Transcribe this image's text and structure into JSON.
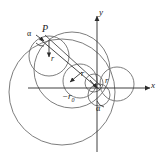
{
  "figure": {
    "type": "geometric-diagram",
    "background_color": "#ffffff",
    "circle_stroke_color": "#6e6e6e",
    "axis_color": "#2b2b2b",
    "line_color": "#333333"
  },
  "axes": {
    "x_label": "x",
    "y_label": "y",
    "origin_x": 97,
    "origin_y": 88,
    "x_axis_y": 88,
    "y_axis_x": 97,
    "x_range_px": [
      28,
      152
    ],
    "y_range_px": [
      14,
      152
    ]
  },
  "labels": {
    "point_p": "P",
    "alpha_upper": "α",
    "alpha_lower": "α",
    "radius_1": "r",
    "radius_2": "r",
    "radius_3": "r",
    "r_zero": "−r",
    "r_zero_sub": "0"
  },
  "circles": [
    {
      "name": "outer-large-circle",
      "cx": 62,
      "cy": 92,
      "r": 53
    },
    {
      "name": "upper-large-circle",
      "cx": 72,
      "cy": 70,
      "r": 38
    },
    {
      "name": "upper-left-circle",
      "cx": 49,
      "cy": 56,
      "r": 20
    },
    {
      "name": "center-circle",
      "cx": 80,
      "cy": 81,
      "r": 17
    },
    {
      "name": "right-circle",
      "cx": 117,
      "cy": 84,
      "r": 17
    },
    {
      "name": "small-origin-circle",
      "cx": 94,
      "cy": 83,
      "r": 9
    },
    {
      "name": "lower-origin-circle",
      "cx": 99,
      "cy": 95,
      "r": 11
    }
  ],
  "ray": {
    "name": "ray-through-p",
    "from_x": 41,
    "from_y": 40,
    "to_x": 99,
    "to_y": 89
  },
  "point_p": {
    "x": 44,
    "y": 37
  }
}
